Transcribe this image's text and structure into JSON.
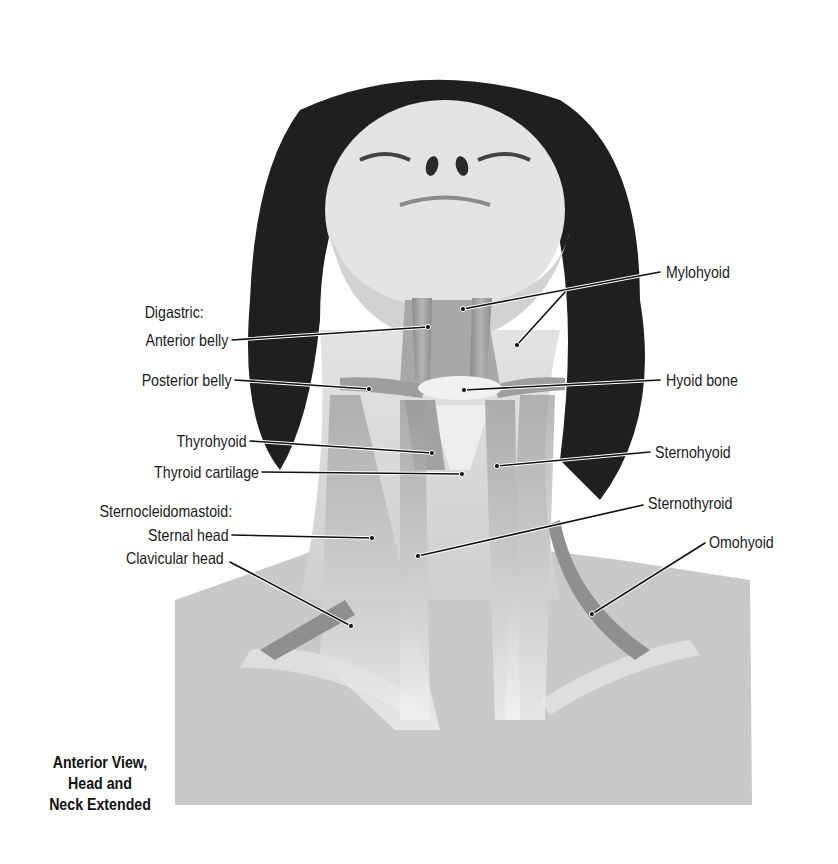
{
  "figure": {
    "title_lines": [
      "Anterior View,",
      "Head and",
      "Neck Extended"
    ],
    "colors": {
      "background": "#ffffff",
      "hair": "#1e1e1e",
      "skin": "#d9d9d9",
      "skin_light": "#e8e8e8",
      "muscle": "#9a9a9a",
      "muscle_dark": "#7d7d7d",
      "bone": "#f2f2f2",
      "leader_line": "#111111",
      "label_text": "#1a1a1a"
    }
  },
  "labels": {
    "left": {
      "digastric_group": "Digastric:",
      "anterior_belly": "Anterior belly",
      "posterior_belly": "Posterior belly",
      "thyrohyoid": "Thyrohyoid",
      "thyroid_cartilage": "Thyroid cartilage",
      "scm_group": "Sternocleidomastoid:",
      "sternal_head": "Sternal head",
      "clavicular_head": "Clavicular head"
    },
    "right": {
      "mylohyoid": "Mylohyoid",
      "hyoid_bone": "Hyoid bone",
      "sternohyoid": "Sternohyoid",
      "sternothyroid": "Sternothyroid",
      "omohyoid": "Omohyoid"
    }
  }
}
